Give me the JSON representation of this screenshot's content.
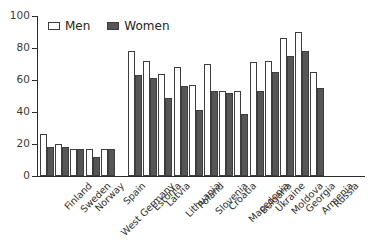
{
  "chart_data": {
    "type": "bar",
    "title": "",
    "subtitle": "",
    "xlabel": "",
    "ylabel": "",
    "ylim": [
      0,
      100
    ],
    "yticks": [
      0,
      20,
      40,
      60,
      80,
      100
    ],
    "grid": false,
    "legend_position": "top-left",
    "categories": [
      "Finland",
      "Sweden",
      "Norway",
      "West Germany",
      "Spain",
      "Estonia",
      "Latvia",
      "Lithuania",
      "Poland",
      "Slovenia",
      "Croatia",
      "Macedonia",
      "Bulgaria",
      "Ukraine",
      "Moldova",
      "Georgia",
      "Armenia",
      "Russia"
    ],
    "group_break_after": "Spain",
    "series": [
      {
        "name": "Men",
        "color": "#ffffff",
        "values": [
          26,
          20,
          17,
          17,
          17,
          78,
          72,
          64,
          68,
          57,
          70,
          53,
          53,
          71,
          72,
          86,
          90,
          65
        ]
      },
      {
        "name": "Women",
        "color": "#565656",
        "values": [
          18,
          18,
          17,
          12,
          17,
          63,
          61,
          49,
          56,
          41,
          53,
          52,
          39,
          53,
          65,
          75,
          78,
          55
        ]
      }
    ],
    "annotations": []
  },
  "legend": {
    "entries": [
      {
        "label": "Men",
        "swatch": "open-square"
      },
      {
        "label": "Women",
        "swatch": "filled-square"
      }
    ]
  },
  "axis": {
    "y_tick_labels": [
      "0",
      "20",
      "40",
      "60",
      "80",
      "100"
    ]
  }
}
